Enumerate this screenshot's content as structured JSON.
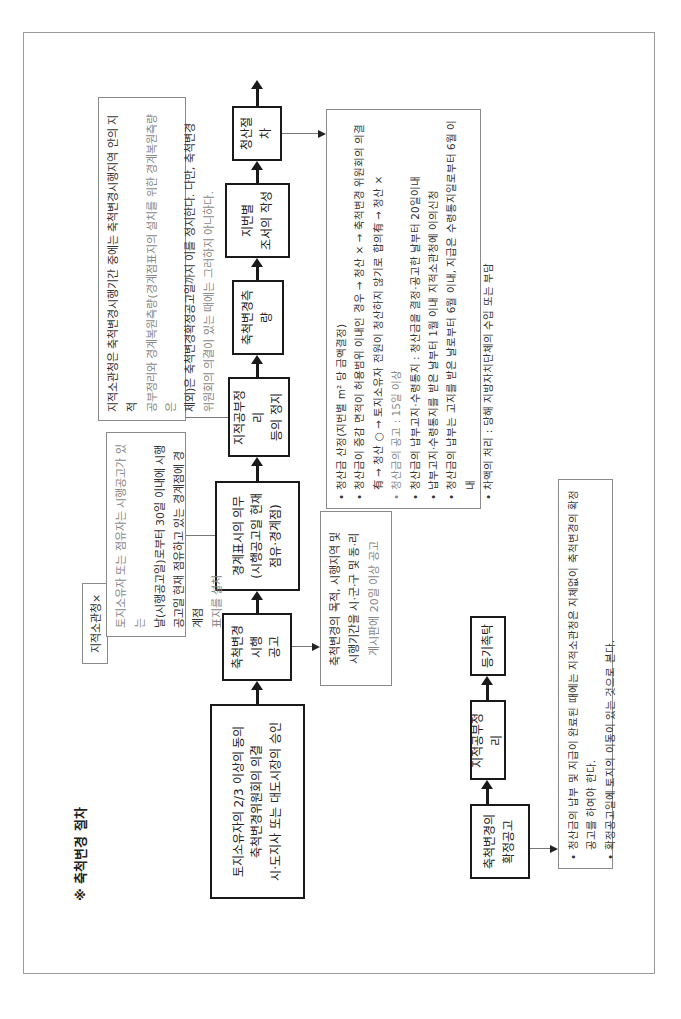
{
  "title": "※ 축척변경 절차",
  "flow_main": {
    "step1": [
      "토지소유자의 2/3 이상의 동의",
      "축척변경위원회의 의결",
      "시·도지사 또는 대도시장의 승인"
    ],
    "step2": [
      "축척변경시행",
      "공고"
    ],
    "step3": [
      "경계표시의 의무",
      "(시행공고일 현재",
      "점유·경계점)"
    ],
    "step4": [
      "지적공부정리",
      "등의 정지"
    ],
    "step5": [
      "축척변경측량"
    ],
    "step6": [
      "지번별",
      "조서의 작성"
    ],
    "step7": [
      "청산절차"
    ]
  },
  "flow_final": {
    "step1": [
      "축척변경의",
      "확정공고"
    ],
    "step2": [
      "지적공부정리"
    ],
    "step3": [
      "등기촉탁"
    ]
  },
  "notes": {
    "public_notice": [
      "축척변경의 목적, 시행지역 및",
      "시행기간을 시·군·구 및 동·리",
      "게시판에 20일 이상 공고"
    ],
    "boundary_tag": "지적소관청×",
    "boundary": [
      "토지소유자 또는 점유자는 시행공고가 있는",
      "날(시행공고일)로부터 30일 이내에 시행",
      "공고일 현재 점유하고 있는 경계점에 경계점",
      "표지를 설치"
    ],
    "suspension": [
      "지적소관청은 축척변경시행기간 중에는 축척변경시행지역 안의 지적",
      "공부정리와 경계복원측량(경계점표지의 설치를 위한 경계복원측량은",
      "제외)은 축척변경확정공고일까지 이를 정지한다. 다만, 축척변경",
      "위원회의 의결이 있는 때에는 그러하지 아니하다."
    ],
    "settlement": [
      "청산금 산정(지번별 m² 당 금액결정)",
      "청산금이 증감 면적이 허용범위 이내인 경우 → 청산 × → 축척변경 위원회의 의결有 → 청산 ○ → 토지소유자 전원이 청산하지 않기로 합의有 → 청산 ×",
      "청산금의 공고 : 15일 이상",
      "청산금의 납부고지·수령통지 : 청산금을 결정·공고한 날부터 20일이내",
      "납부고지·수령통지를 받은 날부터 1월 이내 지적소관청에 이의신청",
      "청산금의 납부는 고지를 받은 날로부터 6월 이내, 지급은 수령통지일로부터 6월 이내",
      "차액의 처리 : 당해 지방자치단체의 수입 또는 부담"
    ],
    "final": [
      "청산금의 납부 및 지급이 완료된 때에는 지적소관청은 지체없이 축척변경의 확정공고를 하여야 한다.",
      "확정공고일에 토지의 이동이 있는 것으로 본다."
    ]
  }
}
